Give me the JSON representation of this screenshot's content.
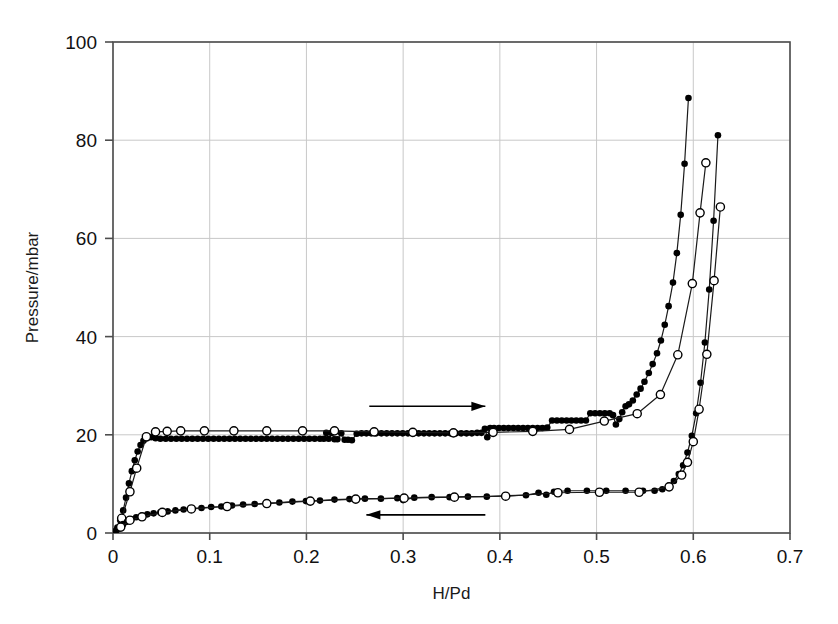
{
  "figure": {
    "kind": "scientific-plot",
    "background": "#ffffff",
    "width": 838,
    "height": 624
  },
  "chart_data": {
    "type": "scatter",
    "title": "",
    "xlabel": "H/Pd",
    "ylabel": "Pressure/mbar",
    "xlim": [
      0,
      0.7
    ],
    "ylim": [
      0,
      100
    ],
    "xticks": [
      0,
      0.1,
      0.2,
      0.3,
      0.4,
      0.5,
      0.6,
      0.7
    ],
    "xticklabels": [
      "0",
      "0.1",
      "0.2",
      "0.3",
      "0.4",
      "0.5",
      "0.6",
      "0.7"
    ],
    "yticks": [
      0,
      20,
      40,
      60,
      80,
      100
    ],
    "yticklabels": [
      "0",
      "20",
      "40",
      "60",
      "80",
      "100"
    ],
    "grid": true,
    "grid_color": "#c8c8c8",
    "frame_color": "#4d4d4d",
    "legend": "none",
    "marker_fill_color": "#000000",
    "marker_open_color": "#ffffff",
    "line_color": "#1a1a1a",
    "annotations": [
      {
        "name": "absorption-arrow",
        "text": "",
        "direction": "right",
        "x_start": 0.265,
        "x_end": 0.385,
        "y": 25.8
      },
      {
        "name": "desorption-arrow",
        "text": "",
        "direction": "left",
        "x_start": 0.385,
        "x_end": 0.262,
        "y": 3.7
      }
    ],
    "series": [
      {
        "name": "absorption-filled",
        "marker": "filled-circle",
        "marker_size": 6.6,
        "points": [
          [
            0.002,
            0.35
          ],
          [
            0.0045,
            1.1
          ],
          [
            0.0075,
            2.6
          ],
          [
            0.0105,
            4.6
          ],
          [
            0.0135,
            7.2
          ],
          [
            0.0165,
            10.1
          ],
          [
            0.0195,
            12.6
          ],
          [
            0.0225,
            14.8
          ],
          [
            0.0255,
            16.6
          ],
          [
            0.0285,
            17.9
          ],
          [
            0.0315,
            18.8
          ],
          [
            0.035,
            19.3
          ],
          [
            0.0395,
            19.5
          ],
          [
            0.044,
            19.3
          ],
          [
            0.049,
            19.2
          ],
          [
            0.0545,
            19.2
          ],
          [
            0.06,
            19.2
          ],
          [
            0.0655,
            19.2
          ],
          [
            0.071,
            19.2
          ],
          [
            0.0765,
            19.2
          ],
          [
            0.082,
            19.2
          ],
          [
            0.0875,
            19.2
          ],
          [
            0.093,
            19.2
          ],
          [
            0.0985,
            19.2
          ],
          [
            0.104,
            19.2
          ],
          [
            0.1095,
            19.2
          ],
          [
            0.115,
            19.2
          ],
          [
            0.1205,
            19.2
          ],
          [
            0.126,
            19.2
          ],
          [
            0.1315,
            19.2
          ],
          [
            0.137,
            19.2
          ],
          [
            0.1425,
            19.2
          ],
          [
            0.148,
            19.2
          ],
          [
            0.1535,
            19.2
          ],
          [
            0.159,
            19.2
          ],
          [
            0.1645,
            19.2
          ],
          [
            0.17,
            19.2
          ],
          [
            0.1755,
            19.2
          ],
          [
            0.181,
            19.2
          ],
          [
            0.1865,
            19.2
          ],
          [
            0.192,
            19.2
          ],
          [
            0.1975,
            19.2
          ],
          [
            0.203,
            19.2
          ],
          [
            0.2085,
            19.2
          ],
          [
            0.214,
            19.2
          ],
          [
            0.218,
            19.2
          ],
          [
            0.2205,
            20.4
          ],
          [
            0.223,
            19.2
          ],
          [
            0.226,
            20.4
          ],
          [
            0.229,
            19.1
          ],
          [
            0.232,
            19.1
          ],
          [
            0.236,
            20.3
          ],
          [
            0.2395,
            19.0
          ],
          [
            0.243,
            19.0
          ],
          [
            0.247,
            18.9
          ],
          [
            0.252,
            20.2
          ],
          [
            0.257,
            20.3
          ],
          [
            0.262,
            20.3
          ],
          [
            0.267,
            20.3
          ],
          [
            0.272,
            20.3
          ],
          [
            0.2775,
            20.3
          ],
          [
            0.283,
            20.3
          ],
          [
            0.2885,
            20.3
          ],
          [
            0.294,
            20.3
          ],
          [
            0.2995,
            20.3
          ],
          [
            0.305,
            20.3
          ],
          [
            0.3105,
            20.3
          ],
          [
            0.316,
            20.3
          ],
          [
            0.3215,
            20.3
          ],
          [
            0.327,
            20.3
          ],
          [
            0.3325,
            20.3
          ],
          [
            0.338,
            20.3
          ],
          [
            0.3435,
            20.3
          ],
          [
            0.349,
            20.3
          ],
          [
            0.3545,
            20.3
          ],
          [
            0.36,
            20.3
          ],
          [
            0.3655,
            20.3
          ],
          [
            0.371,
            20.3
          ],
          [
            0.3765,
            20.4
          ],
          [
            0.381,
            20.4
          ],
          [
            0.3845,
            21.2
          ],
          [
            0.387,
            19.5
          ],
          [
            0.39,
            21.4
          ],
          [
            0.394,
            21.4
          ],
          [
            0.399,
            21.4
          ],
          [
            0.404,
            21.4
          ],
          [
            0.409,
            21.4
          ],
          [
            0.414,
            21.4
          ],
          [
            0.419,
            21.4
          ],
          [
            0.424,
            21.4
          ],
          [
            0.429,
            21.4
          ],
          [
            0.434,
            21.4
          ],
          [
            0.439,
            21.4
          ],
          [
            0.444,
            21.4
          ],
          [
            0.449,
            21.5
          ],
          [
            0.454,
            22.9
          ],
          [
            0.459,
            22.9
          ],
          [
            0.464,
            22.9
          ],
          [
            0.469,
            22.9
          ],
          [
            0.474,
            22.9
          ],
          [
            0.479,
            22.9
          ],
          [
            0.484,
            22.9
          ],
          [
            0.489,
            22.9
          ],
          [
            0.4935,
            24.4
          ],
          [
            0.4985,
            24.4
          ],
          [
            0.5035,
            24.4
          ],
          [
            0.5085,
            24.4
          ],
          [
            0.5135,
            24.4
          ],
          [
            0.517,
            24.0
          ],
          [
            0.52,
            22.1
          ],
          [
            0.5235,
            23.2
          ],
          [
            0.5265,
            24.6
          ],
          [
            0.53,
            25.8
          ],
          [
            0.5335,
            26.2
          ],
          [
            0.5375,
            27.0
          ],
          [
            0.5415,
            28.2
          ],
          [
            0.5455,
            29.4
          ],
          [
            0.5495,
            30.8
          ],
          [
            0.554,
            32.6
          ],
          [
            0.558,
            34.4
          ],
          [
            0.5625,
            36.6
          ],
          [
            0.5665,
            39.2
          ],
          [
            0.5705,
            42.4
          ],
          [
            0.5745,
            46.2
          ],
          [
            0.579,
            51.0
          ],
          [
            0.583,
            57.0
          ],
          [
            0.587,
            64.8
          ],
          [
            0.591,
            75.2
          ],
          [
            0.595,
            88.6
          ]
        ]
      },
      {
        "name": "absorption-open",
        "marker": "open-circle",
        "marker_size": 8.2,
        "points": [
          [
            0.009,
            3.0
          ],
          [
            0.0175,
            8.4
          ],
          [
            0.0245,
            13.2
          ],
          [
            0.0345,
            19.6
          ],
          [
            0.044,
            20.6
          ],
          [
            0.056,
            20.7
          ],
          [
            0.07,
            20.8
          ],
          [
            0.0945,
            20.8
          ],
          [
            0.125,
            20.8
          ],
          [
            0.159,
            20.8
          ],
          [
            0.196,
            20.8
          ],
          [
            0.229,
            20.8
          ],
          [
            0.27,
            20.6
          ],
          [
            0.31,
            20.5
          ],
          [
            0.352,
            20.4
          ],
          [
            0.393,
            20.5
          ],
          [
            0.434,
            20.7
          ],
          [
            0.472,
            21.1
          ],
          [
            0.508,
            22.8
          ],
          [
            0.542,
            24.3
          ],
          [
            0.566,
            28.2
          ],
          [
            0.584,
            36.3
          ],
          [
            0.599,
            50.8
          ],
          [
            0.607,
            65.2
          ],
          [
            0.613,
            75.4
          ]
        ]
      },
      {
        "name": "desorption-filled",
        "marker": "filled-circle",
        "marker_size": 6.6,
        "points": [
          [
            0.0015,
            0.2
          ],
          [
            0.004,
            0.6
          ],
          [
            0.007,
            1.2
          ],
          [
            0.0105,
            1.8
          ],
          [
            0.0145,
            2.3
          ],
          [
            0.019,
            2.8
          ],
          [
            0.024,
            3.2
          ],
          [
            0.0295,
            3.5
          ],
          [
            0.0355,
            3.8
          ],
          [
            0.042,
            4.0
          ],
          [
            0.049,
            4.2
          ],
          [
            0.0565,
            4.4
          ],
          [
            0.0645,
            4.6
          ],
          [
            0.073,
            4.8
          ],
          [
            0.082,
            5.0
          ],
          [
            0.0915,
            5.1
          ],
          [
            0.1015,
            5.3
          ],
          [
            0.112,
            5.4
          ],
          [
            0.123,
            5.6
          ],
          [
            0.1345,
            5.8
          ],
          [
            0.1465,
            5.9
          ],
          [
            0.159,
            6.1
          ],
          [
            0.172,
            6.2
          ],
          [
            0.1855,
            6.4
          ],
          [
            0.1995,
            6.5
          ],
          [
            0.214,
            6.6
          ],
          [
            0.229,
            6.8
          ],
          [
            0.2445,
            6.9
          ],
          [
            0.2605,
            7.0
          ],
          [
            0.277,
            7.0
          ],
          [
            0.294,
            7.1
          ],
          [
            0.3,
            6.7
          ],
          [
            0.3115,
            7.2
          ],
          [
            0.3295,
            7.3
          ],
          [
            0.348,
            7.3
          ],
          [
            0.367,
            7.4
          ],
          [
            0.3865,
            7.4
          ],
          [
            0.4065,
            7.6
          ],
          [
            0.427,
            7.7
          ],
          [
            0.44,
            8.2
          ],
          [
            0.448,
            7.8
          ],
          [
            0.456,
            8.4
          ],
          [
            0.47,
            8.6
          ],
          [
            0.49,
            8.6
          ],
          [
            0.51,
            8.6
          ],
          [
            0.53,
            8.6
          ],
          [
            0.548,
            8.6
          ],
          [
            0.56,
            8.6
          ],
          [
            0.568,
            8.9
          ],
          [
            0.5745,
            9.6
          ],
          [
            0.58,
            10.6
          ],
          [
            0.585,
            12.0
          ],
          [
            0.5895,
            13.8
          ],
          [
            0.594,
            16.4
          ],
          [
            0.5985,
            19.8
          ],
          [
            0.603,
            24.4
          ],
          [
            0.6075,
            30.6
          ],
          [
            0.612,
            38.8
          ],
          [
            0.6165,
            49.6
          ],
          [
            0.621,
            63.6
          ],
          [
            0.6255,
            81.0
          ]
        ]
      },
      {
        "name": "desorption-open",
        "marker": "open-circle",
        "marker_size": 8.2,
        "points": [
          [
            0.008,
            1.2
          ],
          [
            0.0175,
            2.6
          ],
          [
            0.03,
            3.3
          ],
          [
            0.051,
            4.2
          ],
          [
            0.081,
            4.9
          ],
          [
            0.118,
            5.4
          ],
          [
            0.159,
            6.0
          ],
          [
            0.204,
            6.5
          ],
          [
            0.251,
            6.9
          ],
          [
            0.301,
            7.1
          ],
          [
            0.353,
            7.3
          ],
          [
            0.406,
            7.5
          ],
          [
            0.46,
            8.2
          ],
          [
            0.503,
            8.3
          ],
          [
            0.544,
            8.3
          ],
          [
            0.575,
            9.4
          ],
          [
            0.588,
            11.8
          ],
          [
            0.594,
            14.4
          ],
          [
            0.6,
            18.6
          ],
          [
            0.606,
            25.2
          ],
          [
            0.614,
            36.4
          ],
          [
            0.6215,
            51.4
          ],
          [
            0.628,
            66.4
          ]
        ]
      }
    ]
  }
}
